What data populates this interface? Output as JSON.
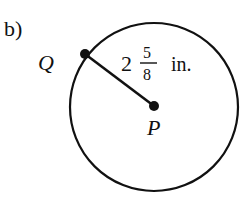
{
  "part_label": "b)",
  "circle": {
    "center_point": "P",
    "radius_point": "Q",
    "radius_whole": "2",
    "radius_numerator": "5",
    "radius_denominator": "8",
    "radius_unit": "in."
  },
  "colors": {
    "stroke": "#111111",
    "background": "#ffffff"
  }
}
